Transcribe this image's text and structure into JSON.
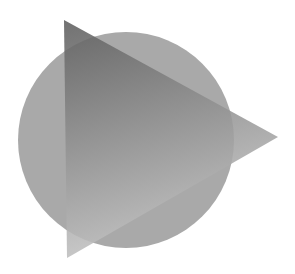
{
  "figure": {
    "background_color": "#ffffff",
    "circle": {
      "fill": "#a9a9a9"
    },
    "triangle": {
      "gradient_top": "#5e5e5e",
      "gradient_bottom": "#c4c4c4",
      "opacity": 0.88
    }
  }
}
